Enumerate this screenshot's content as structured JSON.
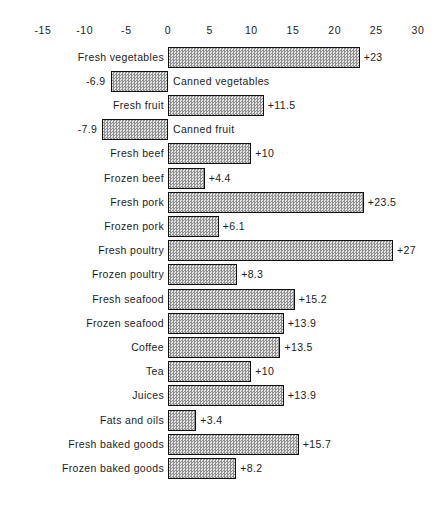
{
  "chart_data": {
    "type": "bar",
    "orientation": "horizontal",
    "title": "",
    "subtitle": "",
    "xlabel": "",
    "ylabel": "",
    "xlim": [
      -15,
      30
    ],
    "xticks": [
      -15,
      -10,
      -5,
      0,
      5,
      10,
      15,
      20,
      25,
      30
    ],
    "xticklabels": [
      "-15",
      "-10",
      "-5",
      "0",
      "5",
      "10",
      "15",
      "20",
      "25",
      "30"
    ],
    "grid": false,
    "legend": null,
    "zero_line": 0,
    "categories": [
      "Fresh vegetables",
      "Canned vegetables",
      "Fresh fruit",
      "Canned fruit",
      "Fresh beef",
      "Frozen beef",
      "Fresh pork",
      "Frozen pork",
      "Fresh poultry",
      "Frozen poultry",
      "Fresh seafood",
      "Frozen seafood",
      "Coffee",
      "Tea",
      "Juices",
      "Fats and oils",
      "Fresh baked goods",
      "Frozen baked goods"
    ],
    "values": [
      23,
      -6.9,
      11.5,
      -7.9,
      10,
      4.4,
      23.5,
      6.1,
      27,
      8.3,
      15.2,
      13.9,
      13.5,
      10,
      13.9,
      3.4,
      15.7,
      8.2
    ],
    "value_labels": [
      "+23",
      "-6.9",
      "+11.5",
      "-7.9",
      "+10",
      "+4.4",
      "+23.5",
      "+6.1",
      "+27",
      "+8.3",
      "+15.2",
      "+13.9",
      "+13.5",
      "+10",
      "+13.9",
      "+3.4",
      "+15.7",
      "+8.2"
    ],
    "bar_fill": "#b9b9b9",
    "bar_edge": "#111111"
  },
  "colors": {
    "background": "#ffffff",
    "text": "#1c1c1c",
    "bar_fill": "#b9b9b9",
    "bar_edge": "#111111"
  }
}
